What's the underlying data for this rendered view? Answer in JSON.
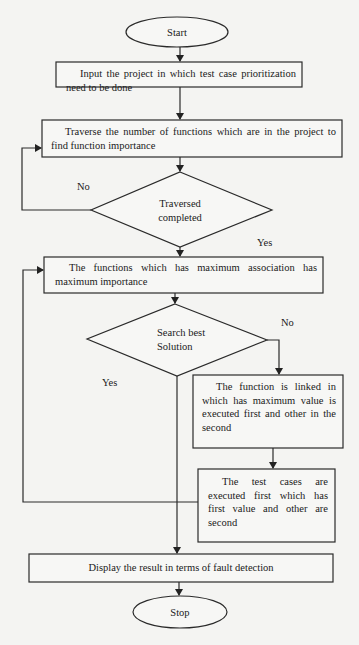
{
  "flowchart": {
    "start": "Start",
    "stop": "Stop",
    "steps": [
      {
        "id": "input",
        "text": "Input the project in which test case prioritization need to be done"
      },
      {
        "id": "traverse",
        "text": "Traverse the number of functions which are in the project to find function importance"
      },
      {
        "id": "max-association",
        "text": "The functions which has maximum association has maximum importance"
      },
      {
        "id": "link-function",
        "text": "The function is linked in which has maximum value is executed first and other in the second"
      },
      {
        "id": "execute-tests",
        "text": "The test cases are executed first which has first value and other are second"
      },
      {
        "id": "display",
        "text": "Display the result in terms of fault detection"
      }
    ],
    "decisions": [
      {
        "id": "traversed",
        "line1": "Traversed",
        "line2": "completed",
        "yes": "Yes",
        "no": "No"
      },
      {
        "id": "search",
        "line1": "Search best",
        "line2": "Solution",
        "yes": "Yes",
        "no": "No"
      }
    ]
  },
  "colors": {
    "stroke": "#2a2a2a",
    "background": "#f4f4f2"
  }
}
